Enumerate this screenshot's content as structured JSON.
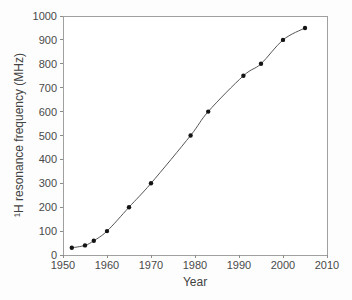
{
  "figure": {
    "background_color": "#fdfdfd",
    "plot_background_color": "#ffffff"
  },
  "chart_data": {
    "type": "line",
    "title": "",
    "xlabel": "Year",
    "ylabel": "¹H resonance frequency (MHz)",
    "series": [
      {
        "x": [
          1952,
          1955,
          1957,
          1960,
          1965,
          1970,
          1979,
          1983,
          1991,
          1995,
          2000,
          2005
        ],
        "y": [
          30,
          40,
          60,
          100,
          200,
          300,
          500,
          600,
          750,
          800,
          900,
          950
        ],
        "marker": "filled-circle",
        "marker_color": "#141414",
        "marker_radius": 2.2,
        "line_color": "#565656",
        "line_width": 1,
        "line_smooth": true
      }
    ],
    "xlim": [
      1950,
      2010
    ],
    "ylim": [
      0,
      1000
    ],
    "xticks": [
      1950,
      1960,
      1970,
      1980,
      1990,
      2000,
      2010
    ],
    "yticks": [
      0,
      100,
      200,
      300,
      400,
      500,
      600,
      700,
      800,
      900,
      1000
    ],
    "tick_length": 3,
    "grid": false,
    "legend_position": "none",
    "frame": "box",
    "axis_color": "#a0a0a0",
    "tick_color": "#8c8c8c",
    "tick_label_color": "#4a4a4a"
  }
}
